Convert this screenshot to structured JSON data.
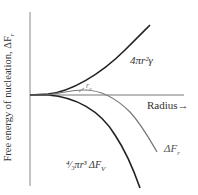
{
  "diagram": {
    "title": "",
    "y_axis_label": "Free energy of nucleation, ΔF",
    "y_axis_label_sub": "r",
    "x_axis_label": "Radius→",
    "curves": [
      {
        "name": "surface-term",
        "label": "4πr²γ",
        "color": "#222222"
      },
      {
        "name": "volume-term",
        "label": "⁴⁄₃πr³ ΔF",
        "label_sub": "V",
        "color": "#222222"
      },
      {
        "name": "total-free-energy",
        "label": "ΔF",
        "label_sub": "r",
        "color": "#777777"
      }
    ],
    "critical_radius_label": "r",
    "critical_radius_sub": "c"
  }
}
